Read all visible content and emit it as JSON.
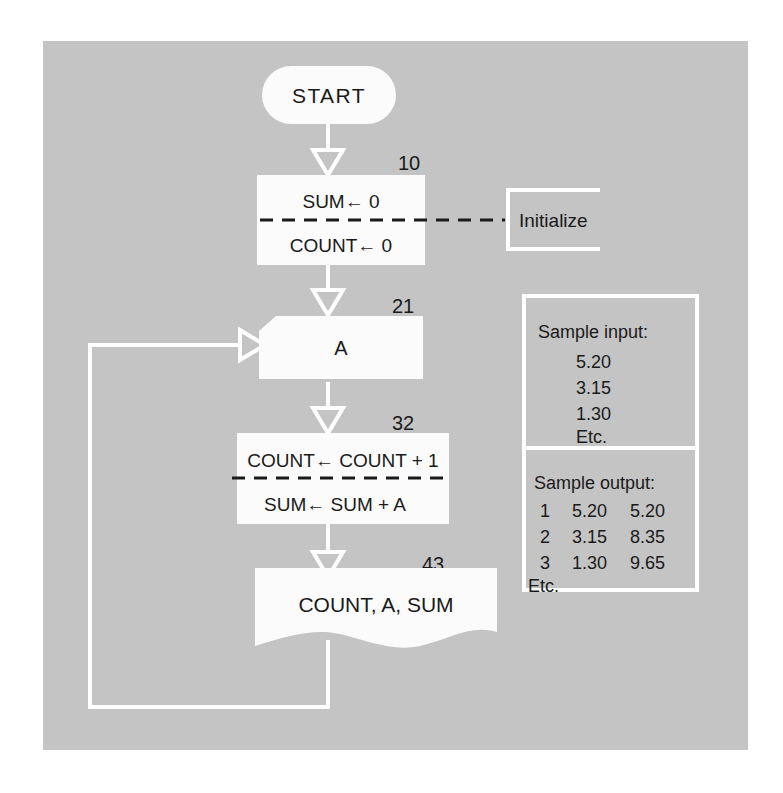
{
  "figure": {
    "background_color": "#ffffff",
    "panel_color": "#c4c4c4",
    "shape_fill": "#fbfbfb",
    "line_color": "#ffffff",
    "text_color": "#1a1a1a"
  },
  "nodes": {
    "start": {
      "label": "START",
      "shape": "terminator"
    },
    "initialize": {
      "step": "10",
      "shape": "process-split",
      "line1": "SUM← 0",
      "line2": "COUNT← 0",
      "annotation": "Initialize"
    },
    "input": {
      "step": "21",
      "shape": "punched-card",
      "label": "A"
    },
    "compute": {
      "step": "32",
      "shape": "process-split",
      "line1": "COUNT← COUNT + 1",
      "line2": "SUM← SUM + A"
    },
    "output": {
      "step": "43",
      "shape": "document",
      "label": "COUNT, A, SUM"
    }
  },
  "sample_panel": {
    "input": {
      "heading": "Sample input:",
      "rows": [
        "5.20",
        "3.15",
        "1.30"
      ],
      "etc": "Etc."
    },
    "output": {
      "heading": "Sample output:",
      "rows": [
        {
          "count": "1",
          "a": "5.20",
          "sum": "5.20"
        },
        {
          "count": "2",
          "a": "3.15",
          "sum": "8.35"
        },
        {
          "count": "3",
          "a": "1.30",
          "sum": "9.65"
        }
      ],
      "etc": "Etc."
    }
  }
}
